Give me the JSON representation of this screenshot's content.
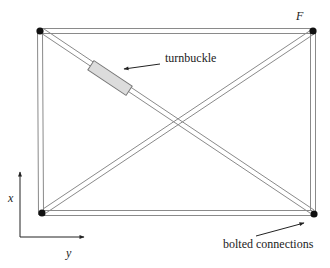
{
  "diagram": {
    "title": "",
    "labels": {
      "force": "F",
      "turnbuckle": "turnbuckle",
      "bolted": "bolted connections",
      "axis_x": "x",
      "axis_y": "y"
    },
    "nodes": [
      {
        "id": "top-left",
        "x": 39,
        "y": 31
      },
      {
        "id": "top-right",
        "x": 313,
        "y": 31
      },
      {
        "id": "bottom-left",
        "x": 41,
        "y": 213
      },
      {
        "id": "bottom-right",
        "x": 314,
        "y": 213
      }
    ],
    "members": [
      {
        "id": "top-chord",
        "from": "top-left",
        "to": "top-right"
      },
      {
        "id": "bottom-chord",
        "from": "bottom-left",
        "to": "bottom-right"
      },
      {
        "id": "left-post",
        "from": "top-left",
        "to": "bottom-left"
      },
      {
        "id": "right-post",
        "from": "top-right",
        "to": "bottom-right"
      },
      {
        "id": "diagonal-tl-br",
        "from": "top-left",
        "to": "bottom-right",
        "has_turnbuckle": true
      },
      {
        "id": "diagonal-bl-tr",
        "from": "bottom-left",
        "to": "top-right"
      }
    ],
    "colors": {
      "member_line": "#8a8a8a",
      "node": "#111111",
      "turnbuckle_fill": "#dcdcdc",
      "turnbuckle_stroke": "#777777",
      "text": "#222222",
      "arrow": "#222222"
    }
  }
}
